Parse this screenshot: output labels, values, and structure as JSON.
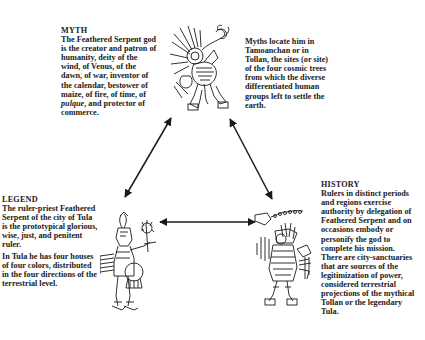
{
  "myth": {
    "heading": "MYTH",
    "lines": [
      "The Feathered Serpent god",
      "is the creator and patron of",
      "humanity, deity of the",
      "wind, of Venus, of the",
      "dawn, of war, inventor of",
      "the calendar, bestower of",
      "maize, of fire, of time, of"
    ],
    "last_line_italic": "pulque",
    "last_line_rest": ", and protector of",
    "final_line": "commerce."
  },
  "myth_locations": {
    "lines": [
      "Myths locate him in",
      "Tamoanchan or in",
      "Tollan, the sites (or site)",
      "of the four cosmic trees",
      "from which the diverse",
      "differentiated human",
      "groups left to settle the",
      "earth."
    ]
  },
  "legend": {
    "heading": "LEGEND",
    "para1": [
      "The ruler-priest Feathered",
      "Serpent of the city of Tula",
      "is the prototypical glorious,",
      "wise, just, and penitent",
      "ruler."
    ],
    "para2": [
      "In Tula he has four houses",
      "of four colors, distributed",
      "in the four directions of the",
      "terrestrial level."
    ]
  },
  "history": {
    "heading": "HISTORY",
    "lines": [
      "Rulers in distinct periods",
      "and regions exercise",
      "authority by delegation of",
      "Feathered Serpent and on",
      "occasions  embody or",
      "personify the god to",
      "complete his mission.",
      "There are city-sanctuaries",
      "that are sources of the",
      "legitimization of power,",
      "considered terrestrial",
      "projections of the mythical",
      "Tollan or the legendary",
      "Tula."
    ]
  },
  "figures": {
    "top": "feathered-serpent-god-codex-figure",
    "left": "tula-ruler-priest-codex-figure",
    "right": "ruler-impersonator-codex-figure"
  },
  "arrows": [
    {
      "from": "myth",
      "to": "legend",
      "bidirectional": true
    },
    {
      "from": "myth",
      "to": "history",
      "bidirectional": true
    },
    {
      "from": "legend",
      "to": "history",
      "bidirectional": true
    }
  ],
  "colors": {
    "ink": "#1a1a1a",
    "background": "#ffffff"
  }
}
